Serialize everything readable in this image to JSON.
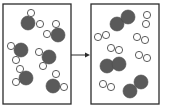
{
  "diagram": {
    "colors": {
      "oxygen_atom": "#5a5a5a",
      "hydrogen_atom": "#ffffff",
      "outline": "#2b2b2b"
    },
    "left_box": {
      "label": "reactants",
      "rect": {
        "x": 3,
        "y": 4,
        "w": 68,
        "h": 100
      },
      "molecules": [
        {
          "type": "H2O",
          "atoms": [
            {
              "el": "O",
              "x": 28,
              "y": 23
            },
            {
              "el": "H",
              "x": 31,
              "y": 13
            },
            {
              "el": "H",
              "x": 40,
              "y": 24
            }
          ]
        },
        {
          "type": "H2O",
          "atoms": [
            {
              "el": "O",
              "x": 58,
              "y": 35
            },
            {
              "el": "H",
              "x": 56,
              "y": 24
            },
            {
              "el": "H",
              "x": 47,
              "y": 34
            }
          ]
        },
        {
          "type": "H2O",
          "atoms": [
            {
              "el": "O",
              "x": 21,
              "y": 50
            },
            {
              "el": "H",
              "x": 11,
              "y": 46
            },
            {
              "el": "H",
              "x": 16,
              "y": 60
            }
          ]
        },
        {
          "type": "H2O",
          "atoms": [
            {
              "el": "O",
              "x": 49,
              "y": 57
            },
            {
              "el": "H",
              "x": 39,
              "y": 52
            },
            {
              "el": "H",
              "x": 43,
              "y": 66
            }
          ]
        },
        {
          "type": "H2O",
          "atoms": [
            {
              "el": "O",
              "x": 26,
              "y": 78
            },
            {
              "el": "H",
              "x": 20,
              "y": 69
            },
            {
              "el": "H",
              "x": 16,
              "y": 82
            }
          ]
        },
        {
          "type": "H2O",
          "atoms": [
            {
              "el": "O",
              "x": 53,
              "y": 86
            },
            {
              "el": "H",
              "x": 56,
              "y": 74
            },
            {
              "el": "H",
              "x": 64,
              "y": 87
            }
          ]
        }
      ]
    },
    "arrow": {
      "x1": 71,
      "y1": 55,
      "x2": 91,
      "y2": 55
    },
    "right_box": {
      "label": "products",
      "rect": {
        "x": 91,
        "y": 4,
        "w": 68,
        "h": 100
      },
      "molecules": [
        {
          "type": "O2",
          "atoms": [
            {
              "el": "O",
              "x": 117,
              "y": 24
            },
            {
              "el": "O",
              "x": 128,
              "y": 17
            }
          ]
        },
        {
          "type": "O2",
          "atoms": [
            {
              "el": "O",
              "x": 107,
              "y": 66
            },
            {
              "el": "O",
              "x": 119,
              "y": 64
            }
          ]
        },
        {
          "type": "O2",
          "atoms": [
            {
              "el": "O",
              "x": 130,
              "y": 91
            },
            {
              "el": "O",
              "x": 141,
              "y": 82
            }
          ]
        },
        {
          "type": "H2",
          "atoms": [
            {
              "el": "H",
              "x": 147,
              "y": 15
            },
            {
              "el": "H",
              "x": 146,
              "y": 24
            }
          ]
        },
        {
          "type": "H2",
          "atoms": [
            {
              "el": "H",
              "x": 98,
              "y": 37
            },
            {
              "el": "H",
              "x": 106,
              "y": 35
            }
          ]
        },
        {
          "type": "H2",
          "atoms": [
            {
              "el": "H",
              "x": 137,
              "y": 37
            },
            {
              "el": "H",
              "x": 145,
              "y": 40
            }
          ]
        },
        {
          "type": "H2",
          "atoms": [
            {
              "el": "H",
              "x": 111,
              "y": 48
            },
            {
              "el": "H",
              "x": 119,
              "y": 50
            }
          ]
        },
        {
          "type": "H2",
          "atoms": [
            {
              "el": "H",
              "x": 139,
              "y": 55
            },
            {
              "el": "H",
              "x": 147,
              "y": 58
            }
          ]
        },
        {
          "type": "H2",
          "atoms": [
            {
              "el": "H",
              "x": 103,
              "y": 84
            },
            {
              "el": "H",
              "x": 111,
              "y": 87
            }
          ]
        }
      ]
    },
    "atom_radius": {
      "O": 7,
      "H": 3.6
    }
  }
}
